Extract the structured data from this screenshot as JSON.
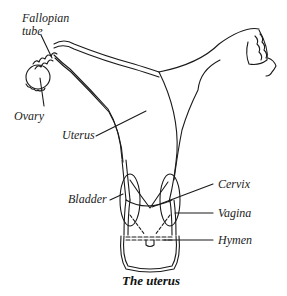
{
  "diagram": {
    "title": "The uterus",
    "labels": {
      "fallopian_tube_1": "Fallopian",
      "fallopian_tube_2": "tube",
      "ovary": "Ovary",
      "uterus": "Uterus",
      "bladder": "Bladder",
      "cervix": "Cervix",
      "vagina": "Vagina",
      "hymen": "Hymen"
    },
    "colors": {
      "line": "#1a1a1a",
      "background": "#ffffff"
    }
  }
}
